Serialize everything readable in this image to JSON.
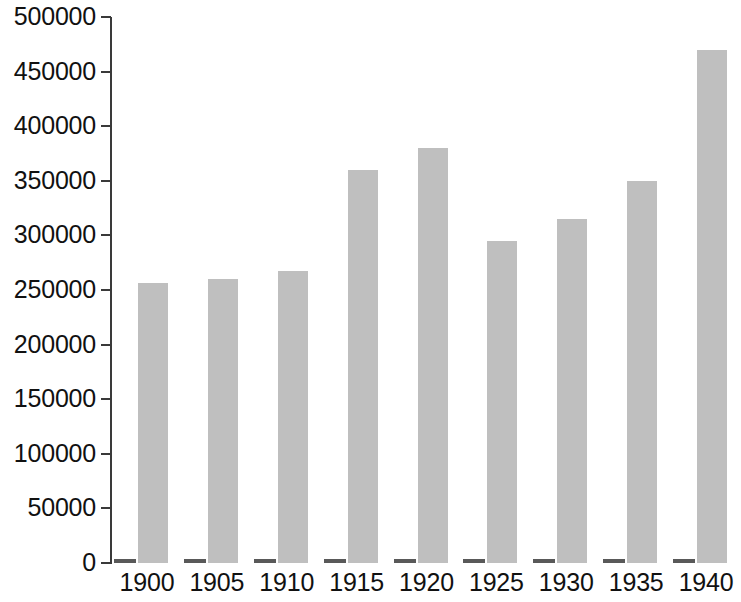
{
  "chart_data": {
    "type": "bar",
    "title": "",
    "subtitle": "",
    "xlabel": "",
    "ylabel": "",
    "categories": [
      "1900",
      "1905",
      "1910",
      "1915",
      "1920",
      "1925",
      "1930",
      "1935",
      "1940"
    ],
    "series": [
      {
        "name": "series-1",
        "color": "#595959",
        "values": [
          0,
          0,
          0,
          0,
          0,
          0,
          0,
          0,
          0
        ]
      },
      {
        "name": "series-2",
        "color": "#bfbfbf",
        "values": [
          256000,
          260000,
          267000,
          360000,
          380000,
          295000,
          315000,
          350000,
          470000
        ]
      }
    ],
    "ylim": [
      0,
      500000
    ],
    "ytick_labels": [
      "500000",
      "450000",
      "400000",
      "350000",
      "300000",
      "250000",
      "200000",
      "150000",
      "100000",
      "50000",
      "0"
    ],
    "ytick_values": [
      500000,
      450000,
      400000,
      350000,
      300000,
      250000,
      200000,
      150000,
      100000,
      50000,
      0
    ],
    "grid": false,
    "legend": false,
    "legend_position": "none",
    "annotations": []
  },
  "colors": {
    "background": "#ffffff",
    "axis": "#3a3a3a",
    "text": "#111111",
    "bar_primary": "#bfbfbf",
    "bar_secondary": "#595959"
  }
}
